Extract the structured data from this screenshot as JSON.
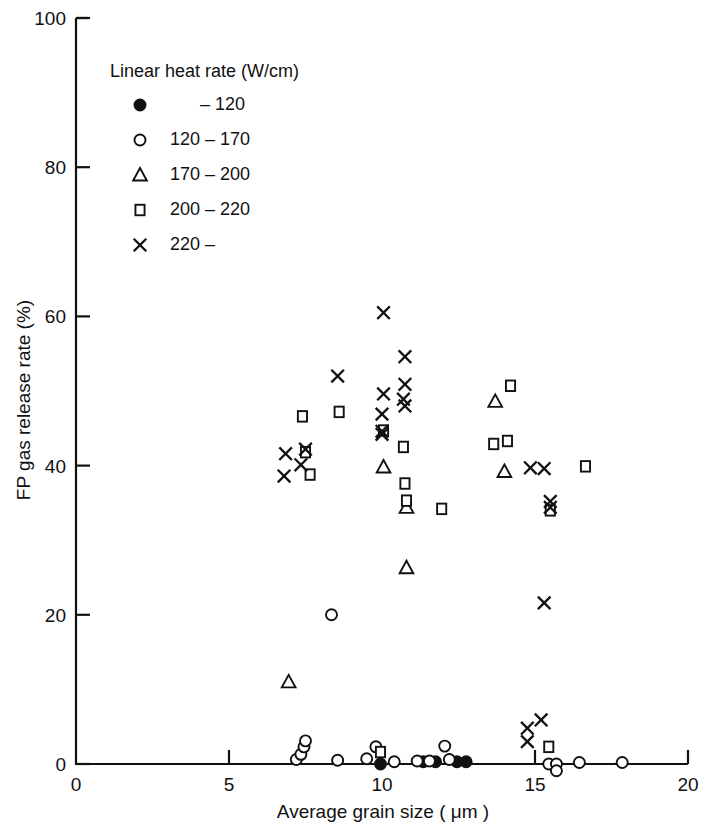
{
  "chart_data": {
    "type": "scatter",
    "title": "",
    "xlabel": "Average grain size ( μm )",
    "ylabel": "FP gas release rate (%)",
    "xlim": [
      0,
      20
    ],
    "ylim": [
      0,
      100
    ],
    "xticks": [
      0,
      5,
      10,
      15,
      20
    ],
    "yticks": [
      0,
      20,
      40,
      60,
      80,
      100
    ],
    "xtick_labels": [
      "0",
      "5",
      "10",
      "15",
      "20"
    ],
    "ytick_labels": [
      "0",
      "20",
      "40",
      "60",
      "80",
      "100"
    ],
    "grid": false,
    "legend_position": "upper-left",
    "legend_title": "Linear heat rate (W/cm)",
    "series": [
      {
        "name": "– 120",
        "marker": "filled-circle",
        "points": [
          [
            9.95,
            0.0
          ],
          [
            11.35,
            0.3
          ],
          [
            11.75,
            0.3
          ],
          [
            12.45,
            0.3
          ],
          [
            12.75,
            0.3
          ]
        ]
      },
      {
        "name": "120 – 170",
        "marker": "open-circle",
        "points": [
          [
            7.2,
            0.6
          ],
          [
            7.35,
            1.3
          ],
          [
            7.45,
            2.3
          ],
          [
            7.5,
            3.1
          ],
          [
            8.55,
            0.5
          ],
          [
            9.5,
            0.7
          ],
          [
            9.8,
            2.3
          ],
          [
            10.4,
            0.3
          ],
          [
            11.15,
            0.4
          ],
          [
            11.55,
            0.4
          ],
          [
            12.05,
            2.4
          ],
          [
            12.2,
            0.6
          ],
          [
            15.45,
            0.0
          ],
          [
            15.7,
            0.0
          ],
          [
            15.7,
            -0.9
          ],
          [
            16.45,
            0.2
          ],
          [
            17.85,
            0.2
          ],
          [
            8.35,
            20.0
          ]
        ]
      },
      {
        "name": "170 – 200",
        "marker": "open-triangle",
        "points": [
          [
            6.95,
            11.0
          ],
          [
            10.05,
            39.8
          ],
          [
            10.8,
            26.3
          ],
          [
            10.8,
            34.4
          ],
          [
            13.7,
            48.6
          ],
          [
            14.0,
            39.2
          ]
        ]
      },
      {
        "name": "200 – 220",
        "marker": "open-square",
        "points": [
          [
            7.4,
            46.6
          ],
          [
            7.5,
            41.8
          ],
          [
            7.65,
            38.8
          ],
          [
            8.6,
            47.2
          ],
          [
            10.05,
            44.7
          ],
          [
            10.7,
            42.5
          ],
          [
            10.75,
            37.6
          ],
          [
            10.8,
            35.3
          ],
          [
            11.95,
            34.2
          ],
          [
            13.65,
            42.9
          ],
          [
            14.1,
            43.3
          ],
          [
            14.2,
            50.7
          ],
          [
            15.5,
            34.0
          ],
          [
            16.65,
            39.9
          ],
          [
            9.95,
            1.6
          ],
          [
            15.45,
            2.3
          ]
        ]
      },
      {
        "name": "220 –",
        "marker": "cross",
        "points": [
          [
            6.85,
            41.6
          ],
          [
            6.8,
            38.6
          ],
          [
            7.35,
            40.1
          ],
          [
            7.5,
            42.2
          ],
          [
            8.55,
            52.0
          ],
          [
            10.05,
            60.5
          ],
          [
            10.05,
            49.6
          ],
          [
            10.0,
            46.9
          ],
          [
            10.0,
            44.6
          ],
          [
            10.0,
            44.2
          ],
          [
            10.75,
            54.6
          ],
          [
            10.75,
            50.9
          ],
          [
            10.7,
            48.9
          ],
          [
            10.75,
            48.0
          ],
          [
            14.85,
            39.7
          ],
          [
            15.3,
            39.6
          ],
          [
            15.5,
            35.2
          ],
          [
            15.5,
            34.4
          ],
          [
            15.3,
            21.6
          ],
          [
            14.75,
            4.8
          ],
          [
            15.2,
            5.9
          ],
          [
            14.75,
            3.0
          ]
        ]
      }
    ]
  },
  "legend": {
    "title": "Linear heat rate (W/cm)",
    "entries": [
      {
        "marker": "filled-circle",
        "label": "– 120"
      },
      {
        "marker": "open-circle",
        "label": "120 – 170"
      },
      {
        "marker": "open-triangle",
        "label": "170 – 200"
      },
      {
        "marker": "open-square",
        "label": "200 – 220"
      },
      {
        "marker": "cross",
        "label": "220 –"
      }
    ]
  }
}
